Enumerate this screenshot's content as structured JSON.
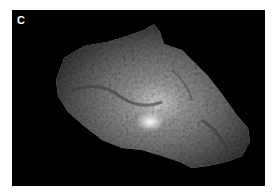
{
  "figure": {
    "panel_label": "C",
    "colors": {
      "background": "#000000",
      "border": "#ffffff",
      "label": "#ffffff"
    }
  }
}
